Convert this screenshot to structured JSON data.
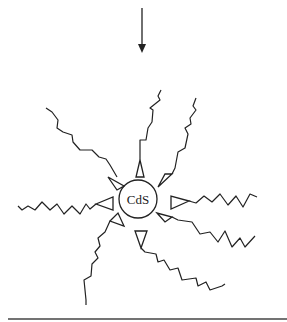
{
  "diagram": {
    "core_label": "CdS",
    "arrow_direction": "down",
    "ligand_count": 8,
    "colors": {
      "stroke": "#222222",
      "background": "#ffffff",
      "baseline": "#444444"
    }
  }
}
